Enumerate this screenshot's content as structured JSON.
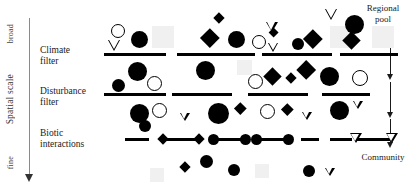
{
  "figure": {
    "title_hidden": "",
    "background": "#ffffff",
    "ink": "#000000",
    "muted": "#f0f0f0"
  },
  "axis": {
    "top_label": "broad",
    "mid_label": "Spatial scale",
    "bottom_label": "fine",
    "arrow_direction": "down"
  },
  "stages": [
    {
      "id": "climate",
      "label": "Climate\nfilter"
    },
    {
      "id": "disturbance",
      "label": "Disturbance\nfilter"
    },
    {
      "id": "biotic",
      "label": "Biotic\ninteractions"
    }
  ],
  "corners": {
    "top_right": "Regional\npool",
    "bottom_right": "Community"
  },
  "chart_data": {
    "type": "diagram",
    "xlabel": "",
    "ylabel": "Spatial scale",
    "legend": [],
    "symbol_types": [
      {
        "name": "filled-circle",
        "meaning": "species type A"
      },
      {
        "name": "open-circle",
        "meaning": "species type B"
      },
      {
        "name": "filled-diamond",
        "meaning": "species type C"
      },
      {
        "name": "open-triangle",
        "meaning": "species type D"
      },
      {
        "name": "grey-square",
        "meaning": "filtered-out species"
      },
      {
        "name": "link-bar",
        "meaning": "biotic interaction between two species"
      }
    ],
    "levels": [
      {
        "level": "regional pool",
        "row": "top",
        "symbol_count": 21
      },
      {
        "level": "post climate filter",
        "row": "second",
        "symbol_count": 16
      },
      {
        "level": "post disturbance filter",
        "row": "third",
        "symbol_count": 14
      },
      {
        "level": "community",
        "row": "bottom",
        "symbol_count": 8
      }
    ],
    "filter_bars": [
      {
        "stage": "climate",
        "segments": 4
      },
      {
        "stage": "disturbance",
        "segments": 4
      },
      {
        "stage": "biotic",
        "segments": 6
      }
    ]
  },
  "symbols": {
    "row1": [
      {
        "t": "circle-o",
        "x": 111,
        "y": 24,
        "s": 14
      },
      {
        "t": "tri-o",
        "x": 108,
        "y": 40,
        "s": 13
      },
      {
        "t": "circle-f",
        "x": 131,
        "y": 31,
        "s": 17
      },
      {
        "t": "sq-g",
        "x": 152,
        "y": 26,
        "s": 22
      },
      {
        "t": "diamond-f",
        "x": 215,
        "y": 14,
        "s": 11
      },
      {
        "t": "diamond-f",
        "x": 203,
        "y": 31,
        "s": 19
      },
      {
        "t": "circle-f",
        "x": 228,
        "y": 31,
        "s": 17
      },
      {
        "t": "circle-o",
        "x": 252,
        "y": 35,
        "s": 14
      },
      {
        "t": "diamond-f",
        "x": 270,
        "y": 29,
        "s": 10
      },
      {
        "t": "tri-o",
        "x": 268,
        "y": 43,
        "s": 11
      },
      {
        "t": "tri-o",
        "x": 266,
        "y": 22,
        "s": 12
      },
      {
        "t": "circle-f",
        "x": 292,
        "y": 38,
        "s": 12
      },
      {
        "t": "diamond-f",
        "x": 306,
        "y": 32,
        "s": 19
      },
      {
        "t": "sq-g",
        "x": 330,
        "y": 26,
        "s": 22
      },
      {
        "t": "tri-o",
        "x": 325,
        "y": 9,
        "s": 13
      },
      {
        "t": "circle-f",
        "x": 345,
        "y": 15,
        "s": 19
      },
      {
        "t": "diamond-f",
        "x": 345,
        "y": 34,
        "s": 18
      },
      {
        "t": "sq-g",
        "x": 372,
        "y": 26,
        "s": 22
      }
    ],
    "row2": [
      {
        "t": "circle-f",
        "x": 128,
        "y": 62,
        "s": 19
      },
      {
        "t": "circle-f",
        "x": 112,
        "y": 79,
        "s": 13
      },
      {
        "t": "circle-o",
        "x": 147,
        "y": 76,
        "s": 15
      },
      {
        "t": "circle-f",
        "x": 196,
        "y": 61,
        "s": 19
      },
      {
        "t": "sq-g",
        "x": 237,
        "y": 60,
        "s": 15
      },
      {
        "t": "circle-o",
        "x": 248,
        "y": 74,
        "s": 15
      },
      {
        "t": "diamond-f",
        "x": 266,
        "y": 70,
        "s": 18
      },
      {
        "t": "diamond-f",
        "x": 287,
        "y": 74,
        "s": 11
      },
      {
        "t": "diamond-f",
        "x": 299,
        "y": 63,
        "s": 20
      },
      {
        "t": "circle-f",
        "x": 320,
        "y": 67,
        "s": 19
      },
      {
        "t": "circle-o",
        "x": 352,
        "y": 70,
        "s": 16
      }
    ],
    "row3": [
      {
        "t": "circle-f",
        "x": 130,
        "y": 104,
        "s": 19
      },
      {
        "t": "circle-o",
        "x": 152,
        "y": 103,
        "s": 15
      },
      {
        "t": "circle-f",
        "x": 139,
        "y": 120,
        "s": 12
      },
      {
        "t": "tri-o",
        "x": 180,
        "y": 113,
        "s": 10
      },
      {
        "t": "circle-f",
        "x": 208,
        "y": 103,
        "s": 21
      },
      {
        "t": "diamond-f",
        "x": 236,
        "y": 104,
        "s": 12
      },
      {
        "t": "circle-o",
        "x": 260,
        "y": 104,
        "s": 15
      },
      {
        "t": "diamond-f",
        "x": 283,
        "y": 105,
        "s": 12
      },
      {
        "t": "tri-o",
        "x": 302,
        "y": 112,
        "s": 10
      },
      {
        "t": "circle-f",
        "x": 330,
        "y": 101,
        "s": 19
      },
      {
        "t": "tri-o",
        "x": 353,
        "y": 101,
        "s": 10
      }
    ],
    "row4": [
      {
        "t": "diamond-f",
        "x": 181,
        "y": 163,
        "s": 11
      },
      {
        "t": "circle-f",
        "x": 200,
        "y": 155,
        "s": 13
      },
      {
        "t": "circle-f",
        "x": 228,
        "y": 164,
        "s": 12
      },
      {
        "t": "circle-f",
        "x": 303,
        "y": 165,
        "s": 12
      },
      {
        "t": "tri-o",
        "x": 325,
        "y": 168,
        "s": 10
      },
      {
        "t": "sq-g",
        "x": 255,
        "y": 164,
        "s": 14
      },
      {
        "t": "sq-g",
        "x": 150,
        "y": 168,
        "s": 14
      }
    ],
    "links": [
      {
        "x": 125,
        "y": 133,
        "w": 24,
        "type": "plain"
      },
      {
        "x": 163,
        "y": 133,
        "w": 36,
        "type": "diamond"
      },
      {
        "x": 213,
        "y": 133,
        "w": 32,
        "type": "circle"
      },
      {
        "x": 256,
        "y": 133,
        "w": 32,
        "type": "circle"
      },
      {
        "x": 301,
        "y": 133,
        "w": 18,
        "type": "plain"
      },
      {
        "x": 330,
        "y": 133,
        "w": 22,
        "type": "plain"
      },
      {
        "x": 355,
        "y": 133,
        "w": 36,
        "type": "triangle"
      }
    ]
  },
  "bars": {
    "climate": [
      {
        "x": 104,
        "y": 53,
        "w": 62
      },
      {
        "x": 177,
        "y": 53,
        "w": 78
      },
      {
        "x": 262,
        "y": 53,
        "w": 70
      },
      {
        "x": 340,
        "y": 53,
        "w": 58
      }
    ],
    "disturbance": [
      {
        "x": 104,
        "y": 93,
        "w": 62
      },
      {
        "x": 172,
        "y": 93,
        "w": 60
      },
      {
        "x": 248,
        "y": 93,
        "w": 60
      },
      {
        "x": 322,
        "y": 93,
        "w": 48
      }
    ]
  }
}
